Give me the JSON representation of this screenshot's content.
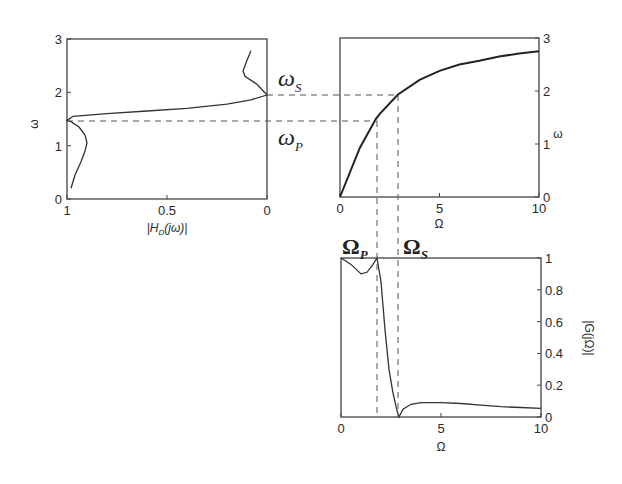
{
  "chart_data": [
    {
      "id": "left",
      "type": "line",
      "title": "",
      "xlabel": "|H_D(jω)|",
      "ylabel": "ω",
      "xlim": [
        1,
        0
      ],
      "ylim": [
        0,
        3
      ],
      "xticks": [
        "1",
        "0.5",
        "0"
      ],
      "yticks": [
        "0",
        "1",
        "2",
        "3"
      ],
      "grid": false,
      "series": [
        {
          "name": "|H_D(jω)|",
          "x": [
            0.98,
            0.96,
            0.93,
            0.91,
            0.9,
            0.91,
            0.94,
            0.98,
            1.0,
            0.97,
            0.8,
            0.6,
            0.4,
            0.2,
            0.08,
            0.0,
            0.05,
            0.11,
            0.12,
            0.1,
            0.08
          ],
          "y": [
            0.2,
            0.45,
            0.7,
            0.9,
            1.05,
            1.2,
            1.35,
            1.45,
            1.47,
            1.55,
            1.6,
            1.65,
            1.7,
            1.78,
            1.86,
            1.95,
            2.15,
            2.3,
            2.4,
            2.6,
            2.78
          ]
        }
      ]
    },
    {
      "id": "upper-right",
      "type": "line",
      "title": "",
      "xlabel": "Ω",
      "ylabel": "ω",
      "xlim": [
        0,
        10
      ],
      "ylim": [
        0,
        3
      ],
      "xticks": [
        "0",
        "5",
        "10"
      ],
      "yticks": [
        "0",
        "1",
        "2",
        "3"
      ],
      "grid": false,
      "series": [
        {
          "name": "ω = 2·atan(Ω/2)",
          "x": [
            0,
            1,
            1.8,
            2,
            2.9,
            4,
            5,
            6,
            7,
            8,
            9,
            10
          ],
          "y": [
            0,
            0.93,
            1.47,
            1.57,
            1.93,
            2.21,
            2.38,
            2.5,
            2.57,
            2.65,
            2.71,
            2.75
          ]
        }
      ]
    },
    {
      "id": "lower-right",
      "type": "line",
      "title": "",
      "xlabel": "Ω",
      "ylabel": "|G(jΩ)|",
      "xlim": [
        0,
        10
      ],
      "ylim": [
        0,
        1
      ],
      "xticks": [
        "0",
        "5",
        "10"
      ],
      "yticks": [
        "0",
        "0.2",
        "0.4",
        "0.6",
        "0.8",
        "1"
      ],
      "grid": false,
      "series": [
        {
          "name": "|G(jΩ)|",
          "x": [
            0,
            0.5,
            1.0,
            1.3,
            1.6,
            1.8,
            2.0,
            2.2,
            2.4,
            2.6,
            2.8,
            2.9,
            3.1,
            3.5,
            4,
            5,
            6,
            7,
            8,
            9,
            10
          ],
          "y": [
            1.0,
            0.96,
            0.9,
            0.91,
            0.96,
            1.0,
            0.85,
            0.55,
            0.3,
            0.15,
            0.04,
            0.0,
            0.05,
            0.08,
            0.09,
            0.09,
            0.085,
            0.075,
            0.065,
            0.06,
            0.055
          ]
        }
      ]
    }
  ],
  "annotations": {
    "omega_s": {
      "symbol": "ω",
      "sub": "S",
      "value": 1.95
    },
    "omega_p": {
      "symbol": "ω",
      "sub": "P",
      "value": 1.47
    },
    "Omega_p": {
      "symbol": "Ω",
      "sub": "P",
      "value": 1.8
    },
    "Omega_s": {
      "symbol": "Ω",
      "sub": "S",
      "value": 2.9
    }
  },
  "labels": {
    "left_ylabel": "ω",
    "left_xlabel_main": "|H",
    "left_xlabel_sub": "D",
    "left_xlabel_tail": "(jω)|",
    "ur_xlabel": "Ω",
    "ur_ylabel": "ω",
    "lr_xlabel": "Ω",
    "lr_ylabel": "|G(jΩ)|"
  }
}
